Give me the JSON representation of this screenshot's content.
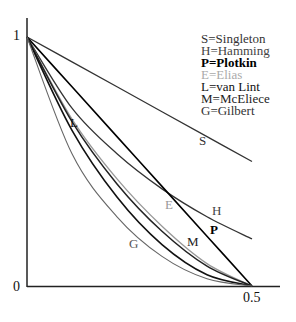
{
  "chart_data": {
    "type": "line",
    "title": "",
    "xlabel": "",
    "ylabel": "",
    "xlim": [
      0,
      0.5
    ],
    "ylim": [
      0,
      1
    ],
    "x_ticks": [
      "0.5"
    ],
    "y_ticks": [
      "0",
      "1"
    ],
    "grid": false,
    "legend_position": "top-right",
    "series": [
      {
        "key": "S",
        "name": "Singleton",
        "color": "#333333",
        "x": [
          0,
          0.1,
          0.2,
          0.3,
          0.4,
          0.5
        ],
        "values": [
          1.0,
          0.9,
          0.8,
          0.7,
          0.6,
          0.5
        ]
      },
      {
        "key": "H",
        "name": "Hamming",
        "color": "#333333",
        "x": [
          0,
          0.1,
          0.2,
          0.3,
          0.4,
          0.5
        ],
        "values": [
          1.0,
          0.714,
          0.531,
          0.39,
          0.278,
          0.189
        ]
      },
      {
        "key": "P",
        "name": "Plotkin",
        "color": "#000000",
        "x": [
          0,
          0.1,
          0.2,
          0.3,
          0.4,
          0.5
        ],
        "values": [
          1.0,
          0.8,
          0.6,
          0.4,
          0.2,
          0.0
        ]
      },
      {
        "key": "E",
        "name": "Elias",
        "color": "#999999",
        "x": [
          0,
          0.1,
          0.2,
          0.3,
          0.4,
          0.5
        ],
        "values": [
          1.0,
          0.67,
          0.43,
          0.24,
          0.09,
          0.0
        ]
      },
      {
        "key": "L",
        "name": "van Lint",
        "color": "#222222",
        "x": [
          0,
          0.1,
          0.2,
          0.3,
          0.4,
          0.5
        ],
        "values": [
          1.0,
          0.66,
          0.41,
          0.22,
          0.08,
          0.0
        ]
      },
      {
        "key": "M",
        "name": "McEliece",
        "color": "#111111",
        "x": [
          0,
          0.1,
          0.2,
          0.3,
          0.4,
          0.5
        ],
        "values": [
          1.0,
          0.625,
          0.357,
          0.166,
          0.045,
          0.0
        ]
      },
      {
        "key": "G",
        "name": "Gilbert",
        "color": "#666666",
        "x": [
          0,
          0.1,
          0.2,
          0.3,
          0.4,
          0.5
        ],
        "values": [
          1.0,
          0.531,
          0.278,
          0.119,
          0.029,
          0.0
        ]
      }
    ],
    "annotations": [
      {
        "text": "S",
        "x": 0.392,
        "y": 0.59
      },
      {
        "text": "H",
        "x": 0.42,
        "y": 0.31
      },
      {
        "text": "P",
        "x": 0.418,
        "y": 0.23
      },
      {
        "text": "E",
        "x": 0.325,
        "y": 0.33
      },
      {
        "text": "L",
        "x": 0.103,
        "y": 0.665
      },
      {
        "text": "M",
        "x": 0.368,
        "y": 0.185
      },
      {
        "text": "G",
        "x": 0.236,
        "y": 0.175
      }
    ]
  },
  "legend": [
    {
      "text": "S=Singleton",
      "color": "#333333",
      "bold": false
    },
    {
      "text": "H=Hamming",
      "color": "#444444",
      "bold": false
    },
    {
      "text": "P=Plotkin",
      "color": "#000000",
      "bold": true
    },
    {
      "text": "E=Elias",
      "color": "#aaaaaa",
      "bold": false
    },
    {
      "text": "L=van Lint",
      "color": "#111111",
      "bold": false
    },
    {
      "text": "M=McEliece",
      "color": "#222222",
      "bold": false
    },
    {
      "text": "G=Gilbert",
      "color": "#333333",
      "bold": false
    }
  ],
  "axis": {
    "y_top_label": "1",
    "origin_label": "0",
    "x_end_label": "0.5"
  }
}
